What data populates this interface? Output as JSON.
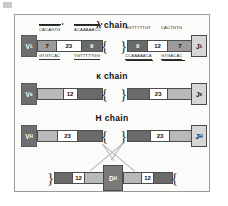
{
  "figure": {
    "chains": [
      {
        "title": "λ chain",
        "left_label": "V",
        "left_sub": "λ",
        "right_label": "J",
        "right_sub": "λ",
        "left_arm": [
          {
            "value": "7",
            "style": "mid"
          },
          {
            "value": "23",
            "style": "white"
          },
          {
            "value": "9",
            "style": "dark"
          }
        ],
        "right_arm": [
          {
            "value": "9",
            "style": "dark"
          },
          {
            "value": "12",
            "style": "white"
          },
          {
            "value": "7",
            "style": "mid"
          }
        ],
        "sequences": [
          {
            "text": "CACAGTG",
            "position": "top-left"
          },
          {
            "text": "GTGTCAC",
            "position": "bottom-left"
          },
          {
            "text": "ACAAAAACC",
            "position": "top-mid"
          },
          {
            "text": "TGTTTTTGG",
            "position": "bottom-mid"
          },
          {
            "text": "GGTTTTTGT",
            "position": "top-right-a"
          },
          {
            "text": "CACTGTG",
            "position": "top-right-b"
          },
          {
            "text": "CCAAAAACA",
            "position": "bottom-right-a"
          },
          {
            "text": "GTGACAC",
            "position": "bottom-right-b"
          }
        ]
      },
      {
        "title": "κ chain",
        "left_label": "V",
        "left_sub": "κ",
        "right_label": "J",
        "right_sub": "κ",
        "left_arm": [
          {
            "value": "",
            "style": "light"
          },
          {
            "value": "12",
            "style": "white"
          },
          {
            "value": "",
            "style": "dark"
          }
        ],
        "right_arm": [
          {
            "value": "",
            "style": "dark"
          },
          {
            "value": "23",
            "style": "white"
          },
          {
            "value": "",
            "style": "light"
          }
        ],
        "sequences": []
      },
      {
        "title": "H chain",
        "left_label": "V",
        "left_sub": "H",
        "right_label": "J",
        "right_sub": "H",
        "left_arm": [
          {
            "value": "",
            "style": "light"
          },
          {
            "value": "23",
            "style": "white"
          },
          {
            "value": "",
            "style": "dark"
          }
        ],
        "right_arm": [
          {
            "value": "",
            "style": "dark"
          },
          {
            "value": "23",
            "style": "white"
          },
          {
            "value": "",
            "style": "light"
          }
        ],
        "sequences": []
      }
    ],
    "d_segment": {
      "label": "D",
      "sub": "H",
      "left_arm": [
        {
          "value": "",
          "style": "dark"
        },
        {
          "value": "12",
          "style": "white"
        },
        {
          "value": "",
          "style": "light"
        }
      ],
      "right_arm": [
        {
          "value": "",
          "style": "light"
        },
        {
          "value": "12",
          "style": "white"
        },
        {
          "value": "",
          "style": "dark"
        }
      ]
    }
  }
}
